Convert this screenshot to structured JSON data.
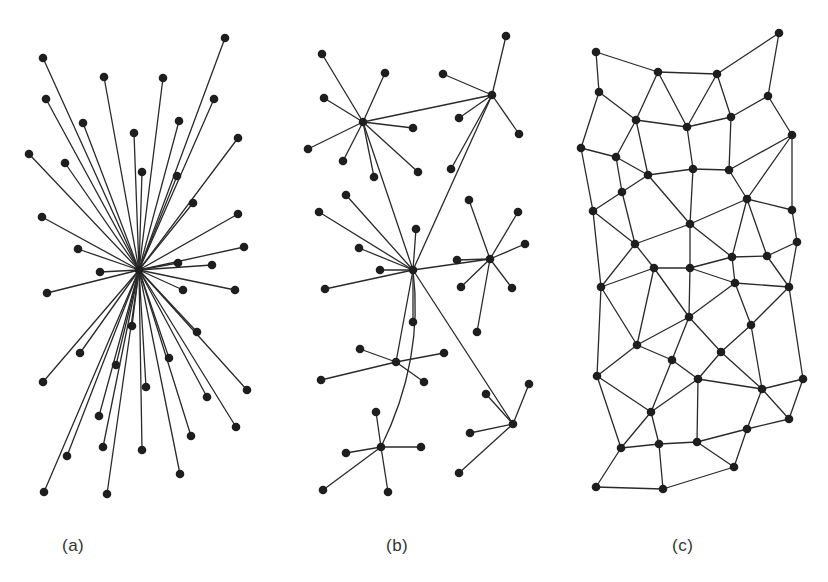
{
  "figure": {
    "width": 828,
    "height": 582,
    "edge_color": "#2a2a2a",
    "node_color": "#1e1e1e",
    "node_radius": 4.3
  },
  "panels": [
    {
      "id": "a",
      "label": "(a)",
      "label_x": 62,
      "type": "centralized",
      "hub": [
        139,
        270
      ],
      "nodes": [
        [
          225,
          38
        ],
        [
          43,
          58
        ],
        [
          104,
          77
        ],
        [
          163,
          78
        ],
        [
          46,
          99
        ],
        [
          214,
          99
        ],
        [
          83,
          123
        ],
        [
          179,
          121
        ],
        [
          134,
          133
        ],
        [
          238,
          138
        ],
        [
          29,
          154
        ],
        [
          65,
          163
        ],
        [
          142,
          172
        ],
        [
          177,
          176
        ],
        [
          193,
          203
        ],
        [
          42,
          217
        ],
        [
          238,
          214
        ],
        [
          78,
          249
        ],
        [
          244,
          247
        ],
        [
          178,
          263
        ],
        [
          212,
          265
        ],
        [
          100,
          272
        ],
        [
          47,
          293
        ],
        [
          183,
          290
        ],
        [
          235,
          290
        ],
        [
          132,
          326
        ],
        [
          197,
          332
        ],
        [
          80,
          353
        ],
        [
          169,
          358
        ],
        [
          116,
          365
        ],
        [
          43,
          382
        ],
        [
          146,
          387
        ],
        [
          247,
          390
        ],
        [
          207,
          397
        ],
        [
          99,
          416
        ],
        [
          236,
          427
        ],
        [
          191,
          436
        ],
        [
          103,
          447
        ],
        [
          142,
          450
        ],
        [
          67,
          456
        ],
        [
          180,
          474
        ],
        [
          44,
          492
        ],
        [
          107,
          494
        ]
      ]
    },
    {
      "id": "b",
      "label": "(b)",
      "label_x": 386,
      "type": "decentralized",
      "hubs": [
        {
          "name": "A",
          "pos": [
            363,
            122
          ],
          "leaves": [
            [
              322,
              54
            ],
            [
              385,
              73
            ],
            [
              324,
              98
            ],
            [
              413,
              128
            ],
            [
              308,
              149
            ],
            [
              343,
              161
            ],
            [
              374,
              177
            ],
            [
              418,
              172
            ]
          ]
        },
        {
          "name": "B",
          "pos": [
            492,
            95
          ],
          "leaves": [
            [
              506,
              36
            ],
            [
              443,
              74
            ],
            [
              459,
              118
            ],
            [
              519,
              134
            ],
            [
              451,
              169
            ]
          ]
        },
        {
          "name": "C",
          "pos": [
            413,
            270
          ],
          "leaves": [
            [
              346,
              195
            ],
            [
              319,
              212
            ],
            [
              416,
              229
            ],
            [
              359,
              248
            ],
            [
              380,
              270
            ],
            [
              325,
              289
            ],
            [
              413,
              322
            ]
          ]
        },
        {
          "name": "D",
          "pos": [
            490,
            259
          ],
          "leaves": [
            [
              469,
              200
            ],
            [
              518,
              212
            ],
            [
              525,
              244
            ],
            [
              457,
              260
            ],
            [
              461,
              287
            ],
            [
              512,
              288
            ],
            [
              477,
              332
            ]
          ]
        },
        {
          "name": "F",
          "pos": [
            396,
            362
          ],
          "leaves": [
            [
              360,
              349
            ],
            [
              444,
              353
            ],
            [
              321,
              380
            ],
            [
              424,
              382
            ]
          ]
        },
        {
          "name": "G",
          "pos": [
            381,
            447
          ],
          "leaves": [
            [
              376,
              412
            ],
            [
              346,
              453
            ],
            [
              421,
              447
            ],
            [
              323,
              490
            ],
            [
              388,
              492
            ]
          ]
        },
        {
          "name": "E",
          "pos": [
            513,
            424
          ],
          "leaves": [
            [
              529,
              384
            ],
            [
              486,
              394
            ],
            [
              470,
              433
            ],
            [
              459,
              473
            ]
          ]
        }
      ],
      "hub_links": [
        {
          "from": "A",
          "to": "B"
        },
        {
          "from": "A",
          "to": "C"
        },
        {
          "from": "B",
          "to": "C"
        },
        {
          "from": "C",
          "to": "D"
        },
        {
          "from": "C",
          "to": "F"
        },
        {
          "from": "C",
          "to": "E"
        },
        {
          "from": "C",
          "to": "G",
          "curve": [
            424,
            360
          ]
        }
      ]
    },
    {
      "id": "c",
      "label": "(c)",
      "label_x": 672,
      "type": "distributed",
      "nodes": [
        [
          596,
          52
        ],
        [
          658,
          72
        ],
        [
          717,
          74
        ],
        [
          779,
          33
        ],
        [
          599,
          92
        ],
        [
          768,
          96
        ],
        [
          636,
          120
        ],
        [
          687,
          127
        ],
        [
          731,
          117
        ],
        [
          792,
          135
        ],
        [
          581,
          148
        ],
        [
          616,
          157
        ],
        [
          648,
          175
        ],
        [
          693,
          169
        ],
        [
          729,
          170
        ],
        [
          622,
          192
        ],
        [
          747,
          199
        ],
        [
          792,
          210
        ],
        [
          593,
          211
        ],
        [
          690,
          224
        ],
        [
          635,
          244
        ],
        [
          797,
          242
        ],
        [
          732,
          257
        ],
        [
          767,
          256
        ],
        [
          654,
          268
        ],
        [
          690,
          268
        ],
        [
          601,
          287
        ],
        [
          735,
          283
        ],
        [
          789,
          287
        ],
        [
          689,
          317
        ],
        [
          751,
          325
        ],
        [
          637,
          345
        ],
        [
          721,
          352
        ],
        [
          672,
          360
        ],
        [
          597,
          376
        ],
        [
          698,
          379
        ],
        [
          803,
          379
        ],
        [
          762,
          389
        ],
        [
          651,
          412
        ],
        [
          789,
          419
        ],
        [
          747,
          429
        ],
        [
          621,
          448
        ],
        [
          659,
          444
        ],
        [
          697,
          442
        ],
        [
          734,
          467
        ],
        [
          596,
          487
        ],
        [
          663,
          489
        ]
      ],
      "edges": [
        [
          1,
          2
        ],
        [
          1,
          5
        ],
        [
          2,
          3
        ],
        [
          3,
          4
        ],
        [
          4,
          6
        ],
        [
          2,
          7
        ],
        [
          2,
          8
        ],
        [
          3,
          8
        ],
        [
          3,
          9
        ],
        [
          5,
          7
        ],
        [
          5,
          11
        ],
        [
          7,
          8
        ],
        [
          8,
          9
        ],
        [
          9,
          6
        ],
        [
          6,
          10
        ],
        [
          7,
          12
        ],
        [
          7,
          13
        ],
        [
          8,
          14
        ],
        [
          9,
          15
        ],
        [
          11,
          12
        ],
        [
          12,
          13
        ],
        [
          13,
          14
        ],
        [
          14,
          15
        ],
        [
          15,
          10
        ],
        [
          11,
          19
        ],
        [
          12,
          16
        ],
        [
          13,
          16
        ],
        [
          13,
          20
        ],
        [
          14,
          20
        ],
        [
          15,
          17
        ],
        [
          10,
          17
        ],
        [
          10,
          18
        ],
        [
          16,
          19
        ],
        [
          16,
          21
        ],
        [
          19,
          21
        ],
        [
          19,
          27
        ],
        [
          20,
          21
        ],
        [
          20,
          23
        ],
        [
          20,
          17
        ],
        [
          17,
          18
        ],
        [
          17,
          23
        ],
        [
          17,
          24
        ],
        [
          18,
          22
        ],
        [
          21,
          25
        ],
        [
          21,
          27
        ],
        [
          23,
          24
        ],
        [
          24,
          22
        ],
        [
          23,
          28
        ],
        [
          25,
          26
        ],
        [
          26,
          23
        ],
        [
          26,
          28
        ],
        [
          28,
          29
        ],
        [
          22,
          29
        ],
        [
          24,
          29
        ],
        [
          25,
          27
        ],
        [
          20,
          26
        ],
        [
          27,
          32
        ],
        [
          25,
          32
        ],
        [
          25,
          30
        ],
        [
          26,
          30
        ],
        [
          28,
          30
        ],
        [
          28,
          31
        ],
        [
          29,
          31
        ],
        [
          29,
          37
        ],
        [
          30,
          32
        ],
        [
          30,
          34
        ],
        [
          30,
          33
        ],
        [
          31,
          33
        ],
        [
          31,
          38
        ],
        [
          32,
          34
        ],
        [
          32,
          35
        ],
        [
          27,
          35
        ],
        [
          34,
          36
        ],
        [
          34,
          39
        ],
        [
          33,
          36
        ],
        [
          33,
          38
        ],
        [
          36,
          38
        ],
        [
          36,
          39
        ],
        [
          36,
          44
        ],
        [
          38,
          37
        ],
        [
          38,
          40
        ],
        [
          37,
          40
        ],
        [
          38,
          41
        ],
        [
          35,
          39
        ],
        [
          35,
          42
        ],
        [
          39,
          42
        ],
        [
          39,
          43
        ],
        [
          42,
          43
        ],
        [
          43,
          44
        ],
        [
          44,
          41
        ],
        [
          44,
          45
        ],
        [
          41,
          40
        ],
        [
          41,
          45
        ],
        [
          42,
          46
        ],
        [
          46,
          47
        ],
        [
          43,
          47
        ],
        [
          47,
          45
        ]
      ]
    }
  ]
}
